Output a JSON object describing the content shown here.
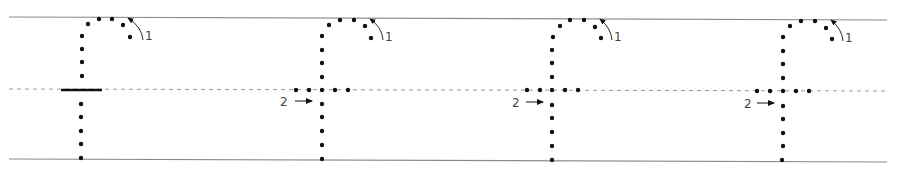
{
  "worksheet": {
    "letter": "f",
    "colors": {
      "ink": "#111111",
      "guide_line": "#8a8a8a",
      "dashed_line": "#9a9a9a",
      "label": "#444444"
    },
    "guides": {
      "top": {
        "x1": 9,
        "y1": 17,
        "x2": 887,
        "y2": 20
      },
      "mid_dashed": {
        "x1": 9,
        "y1": 89,
        "x2": 887,
        "y2": 91
      },
      "bottom": {
        "x1": 9,
        "y1": 159,
        "x2": 887,
        "y2": 162
      }
    },
    "stroke_labels": {
      "stroke1": "1",
      "stroke2": "2"
    },
    "glyphs": [
      {
        "id": 1,
        "stem_x": 82,
        "crossbar": "solid",
        "stroke1_label": "1",
        "stroke2_label": ""
      },
      {
        "id": 2,
        "stem_x": 322,
        "crossbar": "dotted",
        "stroke1_label": "1",
        "stroke2_label": "2"
      },
      {
        "id": 3,
        "stem_x": 552,
        "crossbar": "dotted",
        "stroke1_label": "1",
        "stroke2_label": "2"
      },
      {
        "id": 4,
        "stem_x": 783,
        "crossbar": "dotted",
        "stroke1_label": "1",
        "stroke2_label": "2"
      }
    ]
  }
}
